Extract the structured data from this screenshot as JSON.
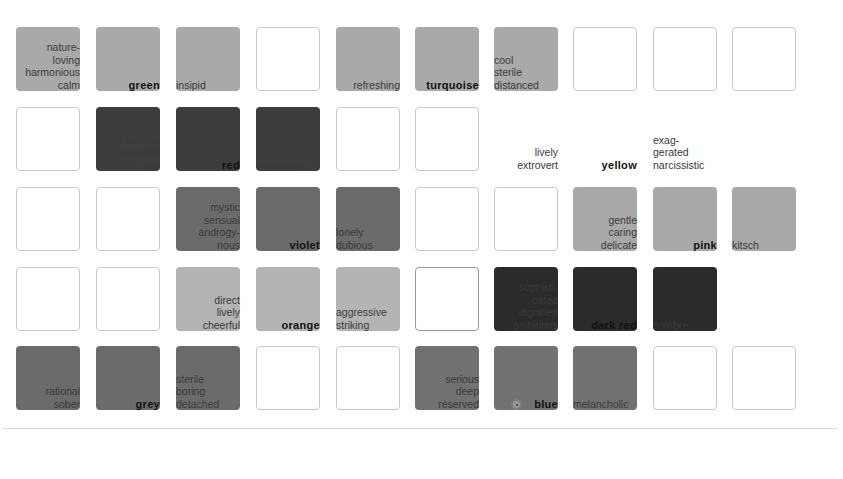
{
  "colors": {
    "light": "#a9a9a9",
    "light2": "#b4b4b4",
    "mid": "#6b6b6b",
    "mid2": "#717171",
    "dark": "#3d3d3d",
    "darkest": "#2b2b2b",
    "empty_border": "#c8c8c8"
  },
  "rows": [
    {
      "cells": [
        {
          "fill": "light",
          "label": {
            "lines": [
              "nature-",
              "loving",
              "harmonious",
              "calm"
            ],
            "align": "right",
            "bold": false
          }
        },
        {
          "fill": "light",
          "label": {
            "lines": [
              "green"
            ],
            "align": "right",
            "bold": true
          }
        },
        {
          "fill": "light",
          "label": {
            "lines": [
              "insipid"
            ],
            "align": "left",
            "bold": false
          }
        },
        {
          "fill": "empty"
        },
        {
          "fill": "light",
          "label": {
            "lines": [
              "refreshing"
            ],
            "align": "right",
            "bold": false
          }
        },
        {
          "fill": "light",
          "label": {
            "lines": [
              "turquoise"
            ],
            "align": "right",
            "bold": true
          }
        },
        {
          "fill": "light",
          "label": {
            "lines": [
              "cool",
              "sterile",
              "distanced"
            ],
            "align": "left",
            "bold": false
          }
        },
        {
          "fill": "empty"
        },
        {
          "fill": "empty"
        },
        {
          "fill": "empty"
        }
      ]
    },
    {
      "cells": [
        {
          "fill": "empty"
        },
        {
          "fill": "dark",
          "label": {
            "lines": [
              "forceful",
              "powerful",
              "vital"
            ],
            "align": "right",
            "bold": false
          }
        },
        {
          "fill": "dark",
          "label": {
            "lines": [
              "red"
            ],
            "align": "right",
            "bold": true
          }
        },
        {
          "fill": "dark",
          "label": {
            "lines": [
              "aggressive"
            ],
            "align": "left",
            "bold": false
          }
        },
        {
          "fill": "empty"
        },
        {
          "fill": "empty"
        },
        {
          "fill": "none",
          "label": {
            "lines": [
              "lively",
              "extrovert"
            ],
            "align": "right",
            "bold": false
          }
        },
        {
          "fill": "none",
          "label": {
            "lines": [
              "yellow"
            ],
            "align": "right",
            "bold": true
          }
        },
        {
          "fill": "none",
          "label": {
            "lines": [
              "exag-",
              "gerated",
              "narcissistic"
            ],
            "align": "left",
            "bold": false
          }
        },
        {
          "fill": "none"
        }
      ]
    },
    {
      "cells": [
        {
          "fill": "empty"
        },
        {
          "fill": "empty"
        },
        {
          "fill": "mid",
          "label": {
            "lines": [
              "mystic",
              "sensual",
              "androgy-",
              "nous"
            ],
            "align": "right",
            "bold": false
          }
        },
        {
          "fill": "mid",
          "label": {
            "lines": [
              "violet"
            ],
            "align": "right",
            "bold": true
          }
        },
        {
          "fill": "mid",
          "label": {
            "lines": [
              "lonely",
              "dubious"
            ],
            "align": "left",
            "bold": false
          }
        },
        {
          "fill": "empty"
        },
        {
          "fill": "empty"
        },
        {
          "fill": "light",
          "label": {
            "lines": [
              "gentle",
              "caring",
              "delicate"
            ],
            "align": "right",
            "bold": false
          }
        },
        {
          "fill": "light",
          "label": {
            "lines": [
              "pink"
            ],
            "align": "right",
            "bold": true
          }
        },
        {
          "fill": "light",
          "label": {
            "lines": [
              "kitsch"
            ],
            "align": "left",
            "bold": false
          }
        }
      ]
    },
    {
      "cells": [
        {
          "fill": "empty"
        },
        {
          "fill": "empty"
        },
        {
          "fill": "light2",
          "label": {
            "lines": [
              "direct",
              "lively",
              "cheerful"
            ],
            "align": "right",
            "bold": false
          }
        },
        {
          "fill": "light2",
          "label": {
            "lines": [
              "orange"
            ],
            "align": "right",
            "bold": true
          }
        },
        {
          "fill": "light2",
          "label": {
            "lines": [
              "aggressive",
              "striking"
            ],
            "align": "left",
            "bold": false
          }
        },
        {
          "fill": "empty-dk"
        },
        {
          "fill": "darkest",
          "label": {
            "lines": [
              "sophisti-",
              "cated",
              "dignified",
              "ambitious"
            ],
            "align": "right",
            "bold": false
          }
        },
        {
          "fill": "darkest",
          "label": {
            "lines": [
              "dark red"
            ],
            "align": "right",
            "bold": true
          }
        },
        {
          "fill": "darkest",
          "label": {
            "lines": [
              "sombre"
            ],
            "align": "left",
            "bold": false
          }
        },
        {
          "fill": "none"
        }
      ]
    },
    {
      "cells": [
        {
          "fill": "mid",
          "label": {
            "lines": [
              "rational",
              "sober"
            ],
            "align": "right",
            "bold": false
          }
        },
        {
          "fill": "mid",
          "label": {
            "lines": [
              "grey"
            ],
            "align": "right",
            "bold": true
          }
        },
        {
          "fill": "mid",
          "label": {
            "lines": [
              "sterile",
              "boring",
              "detached"
            ],
            "align": "left",
            "bold": false
          }
        },
        {
          "fill": "empty"
        },
        {
          "fill": "empty"
        },
        {
          "fill": "mid2",
          "label": {
            "lines": [
              "serious",
              "deep",
              "reserved"
            ],
            "align": "right",
            "bold": false
          }
        },
        {
          "fill": "mid2",
          "label": {
            "lines": [
              "blue"
            ],
            "align": "right",
            "bold": true
          },
          "marker": "radio-dot"
        },
        {
          "fill": "mid2",
          "label": {
            "lines": [
              "melancholic"
            ],
            "align": "left",
            "bold": false
          }
        },
        {
          "fill": "empty"
        },
        {
          "fill": "empty"
        }
      ]
    }
  ]
}
